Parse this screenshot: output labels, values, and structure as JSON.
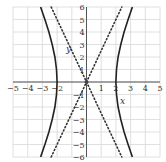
{
  "chart_data": {
    "type": "line",
    "title": "",
    "xlabel": "x",
    "ylabel": "y",
    "xlim": [
      -5,
      5
    ],
    "ylim": [
      -6,
      6
    ],
    "grid": true,
    "x_ticks": [
      -5,
      -4,
      -3,
      -2,
      1,
      2,
      3,
      4,
      5
    ],
    "y_ticks": [
      6,
      5,
      4,
      3,
      2,
      1,
      -1,
      -2,
      -3,
      -4,
      -5,
      -6
    ],
    "series": [
      {
        "name": "hyperbola x^2/4 - y^2/25 = 1 (right branch)",
        "style": "solid",
        "color": "#222222",
        "points": [
          [
            3.12,
            -6
          ],
          [
            2.83,
            -5
          ],
          [
            2.56,
            -4
          ],
          [
            2.33,
            -3
          ],
          [
            2.15,
            -2
          ],
          [
            2.04,
            -1
          ],
          [
            2,
            0
          ],
          [
            2.04,
            1
          ],
          [
            2.15,
            2
          ],
          [
            2.33,
            3
          ],
          [
            2.56,
            4
          ],
          [
            2.83,
            5
          ],
          [
            3.12,
            6
          ]
        ]
      },
      {
        "name": "hyperbola x^2/4 - y^2/25 = 1 (left branch)",
        "style": "solid",
        "color": "#222222",
        "points": [
          [
            -3.12,
            -6
          ],
          [
            -2.83,
            -5
          ],
          [
            -2.56,
            -4
          ],
          [
            -2.33,
            -3
          ],
          [
            -2.15,
            -2
          ],
          [
            -2.04,
            -1
          ],
          [
            -2,
            0
          ],
          [
            -2.04,
            1
          ],
          [
            -2.15,
            2
          ],
          [
            -2.33,
            3
          ],
          [
            -2.56,
            4
          ],
          [
            -2.83,
            5
          ],
          [
            -3.12,
            6
          ]
        ]
      },
      {
        "name": "asymptote y = 2.5x",
        "style": "dotted",
        "color": "#333333",
        "points": [
          [
            -2.4,
            -6
          ],
          [
            2.4,
            6
          ]
        ]
      },
      {
        "name": "asymptote y = -2.5x",
        "style": "dotted",
        "color": "#333333",
        "points": [
          [
            -2.4,
            6
          ],
          [
            2.4,
            -6
          ]
        ]
      }
    ],
    "annotations": [
      {
        "label": "center",
        "point": [
          0,
          0
        ]
      }
    ]
  }
}
